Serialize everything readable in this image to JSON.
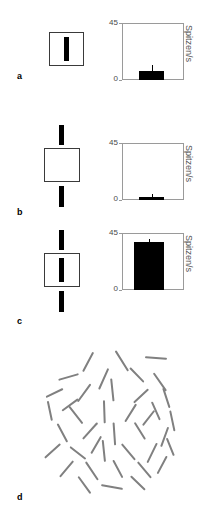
{
  "figure": {
    "panels": [
      {
        "letter": "a",
        "letter_x": 17,
        "letter_y": 72,
        "condition": "short-bar-inside-receptive-field",
        "stimulus": {
          "square": {
            "x": 49,
            "y": 32,
            "w": 35,
            "h": 34
          },
          "bars": [
            {
              "x": 64,
              "y": 37,
              "w": 5,
              "h": 24
            }
          ]
        },
        "chart": {
          "x": 122,
          "y": 23,
          "w": 62,
          "h": 57,
          "bar_value": 7,
          "error": 5,
          "bar_left_frac": 0.28,
          "bar_width_frac": 0.4
        }
      },
      {
        "letter": "b",
        "letter_x": 17,
        "letter_y": 208,
        "condition": "bar-segments-outside-empty-receptive-field",
        "stimulus": {
          "square": {
            "x": 44,
            "y": 148,
            "w": 36,
            "h": 34
          },
          "bars": [
            {
              "x": 59,
              "y": 125,
              "w": 5,
              "h": 20
            },
            {
              "x": 59,
              "y": 186,
              "w": 5,
              "h": 21
            }
          ]
        },
        "chart": {
          "x": 122,
          "y": 143,
          "w": 62,
          "h": 57,
          "bar_value": 2,
          "error": 3,
          "bar_left_frac": 0.28,
          "bar_width_frac": 0.4
        }
      },
      {
        "letter": "c",
        "letter_x": 17,
        "letter_y": 317,
        "condition": "continuous-long-bar-through-receptive-field",
        "stimulus": {
          "square": {
            "x": 44,
            "y": 253,
            "w": 36,
            "h": 34
          },
          "bars": [
            {
              "x": 59,
              "y": 230,
              "w": 5,
              "h": 20
            },
            {
              "x": 59,
              "y": 258,
              "w": 5,
              "h": 24
            },
            {
              "x": 59,
              "y": 291,
              "w": 5,
              "h": 21
            }
          ]
        },
        "chart": {
          "x": 122,
          "y": 233,
          "w": 62,
          "h": 57,
          "bar_value": 38,
          "error": 2,
          "bar_left_frac": 0.2,
          "bar_width_frac": 0.48
        }
      },
      {
        "letter": "d",
        "letter_x": 17,
        "letter_y": 493,
        "condition": "random-orientation-texture-field",
        "texture": {
          "x": 42,
          "y": 355,
          "w": 130,
          "h": 140
        }
      }
    ],
    "chart_data": {
      "type": "bar",
      "title": "",
      "xlabel": "",
      "ylabel": "Spitzen/s",
      "ylim": [
        0,
        45
      ],
      "ytick_labels": [
        "45",
        "0"
      ],
      "ytick_values": [
        45,
        0
      ],
      "grid": false,
      "legend": false,
      "categories": [
        "a",
        "b",
        "c"
      ],
      "values": [
        7,
        2,
        38
      ],
      "errors": [
        5,
        3,
        2
      ],
      "bar_color": "#000000",
      "axis_color": "#9a9a9a",
      "panel_charts": [
        {
          "panel": "a",
          "value": 7,
          "error": 5,
          "ylim": [
            0,
            45
          ],
          "ylabel": "Spitzen/s"
        },
        {
          "panel": "b",
          "value": 2,
          "error": 3,
          "ylim": [
            0,
            45
          ],
          "ylabel": "Spitzen/s"
        },
        {
          "panel": "c",
          "value": 38,
          "error": 2,
          "ylim": [
            0,
            45
          ],
          "ylabel": "Spitzen/s"
        }
      ]
    },
    "axis": {
      "top_tick": "45",
      "bottom_tick": "0",
      "y_axis_title": "Spitzen/s"
    },
    "texture_lines": [
      {
        "x": 88,
        "y": 361,
        "len": 22,
        "angle": -62
      },
      {
        "x": 122,
        "y": 360,
        "len": 24,
        "angle": 58
      },
      {
        "x": 156,
        "y": 357,
        "len": 22,
        "angle": 4
      },
      {
        "x": 68,
        "y": 376,
        "len": 21,
        "angle": -16
      },
      {
        "x": 103,
        "y": 378,
        "len": 23,
        "angle": -66
      },
      {
        "x": 137,
        "y": 374,
        "len": 20,
        "angle": 46
      },
      {
        "x": 160,
        "y": 381,
        "len": 22,
        "angle": 55
      },
      {
        "x": 54,
        "y": 392,
        "len": 19,
        "angle": -26
      },
      {
        "x": 84,
        "y": 392,
        "len": 22,
        "angle": -54
      },
      {
        "x": 112,
        "y": 389,
        "len": 23,
        "angle": 84
      },
      {
        "x": 141,
        "y": 395,
        "len": 20,
        "angle": -43
      },
      {
        "x": 166,
        "y": 397,
        "len": 21,
        "angle": 72
      },
      {
        "x": 50,
        "y": 410,
        "len": 20,
        "angle": 78
      },
      {
        "x": 76,
        "y": 414,
        "len": 22,
        "angle": 52
      },
      {
        "x": 104,
        "y": 411,
        "len": 23,
        "angle": 88
      },
      {
        "x": 130,
        "y": 412,
        "len": 21,
        "angle": -58
      },
      {
        "x": 156,
        "y": 410,
        "len": 20,
        "angle": 66
      },
      {
        "x": 172,
        "y": 420,
        "len": 21,
        "angle": 78
      },
      {
        "x": 62,
        "y": 432,
        "len": 21,
        "angle": 62
      },
      {
        "x": 90,
        "y": 430,
        "len": 22,
        "angle": -48
      },
      {
        "x": 114,
        "y": 433,
        "len": 23,
        "angle": 86
      },
      {
        "x": 140,
        "y": 430,
        "len": 20,
        "angle": 58
      },
      {
        "x": 164,
        "y": 436,
        "len": 21,
        "angle": -70
      },
      {
        "x": 52,
        "y": 450,
        "len": 21,
        "angle": -42
      },
      {
        "x": 78,
        "y": 452,
        "len": 20,
        "angle": 38
      },
      {
        "x": 104,
        "y": 450,
        "len": 22,
        "angle": 84
      },
      {
        "x": 128,
        "y": 451,
        "len": 21,
        "angle": 50
      },
      {
        "x": 152,
        "y": 452,
        "len": 22,
        "angle": -64
      },
      {
        "x": 170,
        "y": 446,
        "len": 19,
        "angle": 68
      },
      {
        "x": 66,
        "y": 468,
        "len": 21,
        "angle": -50
      },
      {
        "x": 92,
        "y": 470,
        "len": 22,
        "angle": 56
      },
      {
        "x": 118,
        "y": 468,
        "len": 20,
        "angle": 62
      },
      {
        "x": 144,
        "y": 469,
        "len": 21,
        "angle": 50
      },
      {
        "x": 162,
        "y": 464,
        "len": 20,
        "angle": -62
      },
      {
        "x": 84,
        "y": 484,
        "len": 21,
        "angle": 54
      },
      {
        "x": 112,
        "y": 486,
        "len": 22,
        "angle": 10
      },
      {
        "x": 138,
        "y": 482,
        "len": 20,
        "angle": 44
      },
      {
        "x": 70,
        "y": 404,
        "len": 20,
        "angle": -36
      },
      {
        "x": 148,
        "y": 417,
        "len": 19,
        "angle": -52
      },
      {
        "x": 96,
        "y": 444,
        "len": 20,
        "angle": -60
      }
    ]
  }
}
